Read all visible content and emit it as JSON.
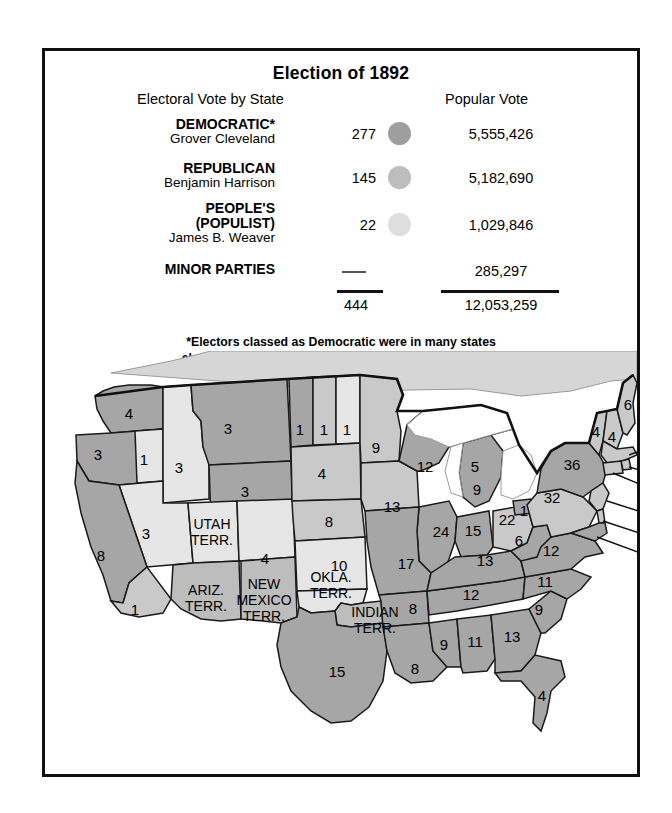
{
  "figure": {
    "title": "Election of 1892",
    "column_headers": {
      "electoral": "Electoral Vote by State",
      "popular": "Popular Vote"
    },
    "footnote_line1": "*Electors classed as Democratic were in many states",
    "footnote_line2": "elected on joint Democratic and People's party tickets."
  },
  "results": {
    "rows": [
      {
        "party": "DEMOCRATIC*",
        "candidate": "Grover Cleveland",
        "electoral": "277",
        "popular": "5,555,426",
        "swatch_color": "#9e9e9e",
        "swatch_name": "democratic-swatch"
      },
      {
        "party": "REPUBLICAN",
        "candidate": "Benjamin Harrison",
        "electoral": "145",
        "popular": "5,182,690",
        "swatch_color": "#bdbdbd",
        "swatch_name": "republican-swatch"
      },
      {
        "party_line1": "PEOPLE'S",
        "party_line2": "(POPULIST)",
        "candidate": "James B. Weaver",
        "electoral": "22",
        "popular": "1,029,846",
        "swatch_color": "#dedede",
        "swatch_name": "populist-swatch"
      }
    ],
    "minor": {
      "party": "MINOR PARTIES",
      "electoral": "—",
      "popular": "285,297"
    },
    "totals": {
      "electoral": "444",
      "popular": "12,053,259"
    }
  },
  "map": {
    "caption_territories": [
      "UTAH TERR.",
      "ARIZ. TERR.",
      "NEW MEXICO TERR.",
      "OKLA. TERR.",
      "INDIAN TERR."
    ],
    "labels": [
      {
        "state": "washington",
        "value": "4",
        "x": 78,
        "y": 62,
        "party": "dem"
      },
      {
        "state": "oregon",
        "value": "3",
        "x": 47,
        "y": 103,
        "party": "dem"
      },
      {
        "state": "oregon-split",
        "value": "1",
        "x": 93,
        "y": 108,
        "party": "pop"
      },
      {
        "state": "idaho",
        "value": "3",
        "x": 128,
        "y": 116,
        "party": "pop"
      },
      {
        "state": "montana",
        "value": "3",
        "x": 177,
        "y": 77,
        "party": "dem"
      },
      {
        "state": "wyoming",
        "value": "3",
        "x": 194,
        "y": 140,
        "party": "dem"
      },
      {
        "state": "nevada",
        "value": "3",
        "x": 95,
        "y": 182,
        "party": "pop"
      },
      {
        "state": "california",
        "value": "8",
        "x": 50,
        "y": 204,
        "party": "dem"
      },
      {
        "state": "california-split",
        "value": "1",
        "x": 84,
        "y": 258,
        "party": "rep"
      },
      {
        "state": "colorado",
        "value": "4",
        "x": 214,
        "y": 207,
        "party": "pop"
      },
      {
        "state": "north-dakota-a",
        "value": "1",
        "x": 249,
        "y": 78,
        "party": "dem"
      },
      {
        "state": "north-dakota-b",
        "value": "1",
        "x": 273,
        "y": 78,
        "party": "rep"
      },
      {
        "state": "north-dakota-c",
        "value": "1",
        "x": 296,
        "y": 78,
        "party": "pop"
      },
      {
        "state": "south-dakota",
        "value": "4",
        "x": 271,
        "y": 122,
        "party": "rep"
      },
      {
        "state": "nebraska",
        "value": "8",
        "x": 278,
        "y": 170,
        "party": "rep"
      },
      {
        "state": "kansas",
        "value": "10",
        "x": 288,
        "y": 214,
        "party": "pop"
      },
      {
        "state": "minnesota",
        "value": "9",
        "x": 325,
        "y": 96,
        "party": "rep"
      },
      {
        "state": "iowa",
        "value": "13",
        "x": 341,
        "y": 155,
        "party": "rep"
      },
      {
        "state": "wisconsin",
        "value": "12",
        "x": 374,
        "y": 115,
        "party": "dem"
      },
      {
        "state": "michigan-upper",
        "value": "5",
        "x": 424,
        "y": 115,
        "party": "rep"
      },
      {
        "state": "michigan-lower",
        "value": "9",
        "x": 426,
        "y": 138,
        "party": "dem"
      },
      {
        "state": "illinois",
        "value": "24",
        "x": 390,
        "y": 180,
        "party": "dem"
      },
      {
        "state": "indiana",
        "value": "15",
        "x": 422,
        "y": 179,
        "party": "dem"
      },
      {
        "state": "ohio-a",
        "value": "22",
        "x": 456,
        "y": 168,
        "party": "rep"
      },
      {
        "state": "ohio-b",
        "value": "1",
        "x": 473,
        "y": 159,
        "party": "dem"
      },
      {
        "state": "missouri",
        "value": "17",
        "x": 355,
        "y": 212,
        "party": "dem"
      },
      {
        "state": "arkansas",
        "value": "8",
        "x": 362,
        "y": 257,
        "party": "dem"
      },
      {
        "state": "texas",
        "value": "15",
        "x": 286,
        "y": 320,
        "party": "dem"
      },
      {
        "state": "louisiana",
        "value": "8",
        "x": 364,
        "y": 317,
        "party": "dem"
      },
      {
        "state": "mississippi",
        "value": "9",
        "x": 393,
        "y": 293,
        "party": "dem"
      },
      {
        "state": "alabama",
        "value": "11",
        "x": 424,
        "y": 290,
        "party": "dem"
      },
      {
        "state": "georgia",
        "value": "13",
        "x": 461,
        "y": 285,
        "party": "dem"
      },
      {
        "state": "florida",
        "value": "4",
        "x": 491,
        "y": 344,
        "party": "dem"
      },
      {
        "state": "tennessee",
        "value": "12",
        "x": 420,
        "y": 243,
        "party": "dem"
      },
      {
        "state": "kentucky",
        "value": "13",
        "x": 434,
        "y": 209,
        "party": "dem"
      },
      {
        "state": "south-carolina",
        "value": "9",
        "x": 488,
        "y": 258,
        "party": "dem"
      },
      {
        "state": "north-carolina",
        "value": "11",
        "x": 494,
        "y": 230,
        "party": "dem"
      },
      {
        "state": "virginia",
        "value": "12",
        "x": 500,
        "y": 199,
        "party": "dem"
      },
      {
        "state": "west-virginia",
        "value": "6",
        "x": 468,
        "y": 189,
        "party": "dem"
      },
      {
        "state": "pennsylvania",
        "value": "32",
        "x": 501,
        "y": 146,
        "party": "rep"
      },
      {
        "state": "new-york",
        "value": "36",
        "x": 521,
        "y": 113,
        "party": "dem"
      },
      {
        "state": "vermont",
        "value": "4",
        "x": 545,
        "y": 80,
        "party": "rep"
      },
      {
        "state": "new-hampshire",
        "value": "4",
        "x": 561,
        "y": 85,
        "party": "rep"
      },
      {
        "state": "maine",
        "value": "6",
        "x": 577,
        "y": 53,
        "party": "rep"
      }
    ],
    "leader_labels": [
      {
        "state": "massachusetts",
        "value": "15"
      },
      {
        "state": "rhode-island",
        "value": "4"
      },
      {
        "state": "connecticut",
        "value": "6"
      },
      {
        "state": "new-jersey",
        "value": "10"
      },
      {
        "state": "delaware",
        "value": "3"
      },
      {
        "state": "maryland",
        "value": "8"
      }
    ]
  }
}
